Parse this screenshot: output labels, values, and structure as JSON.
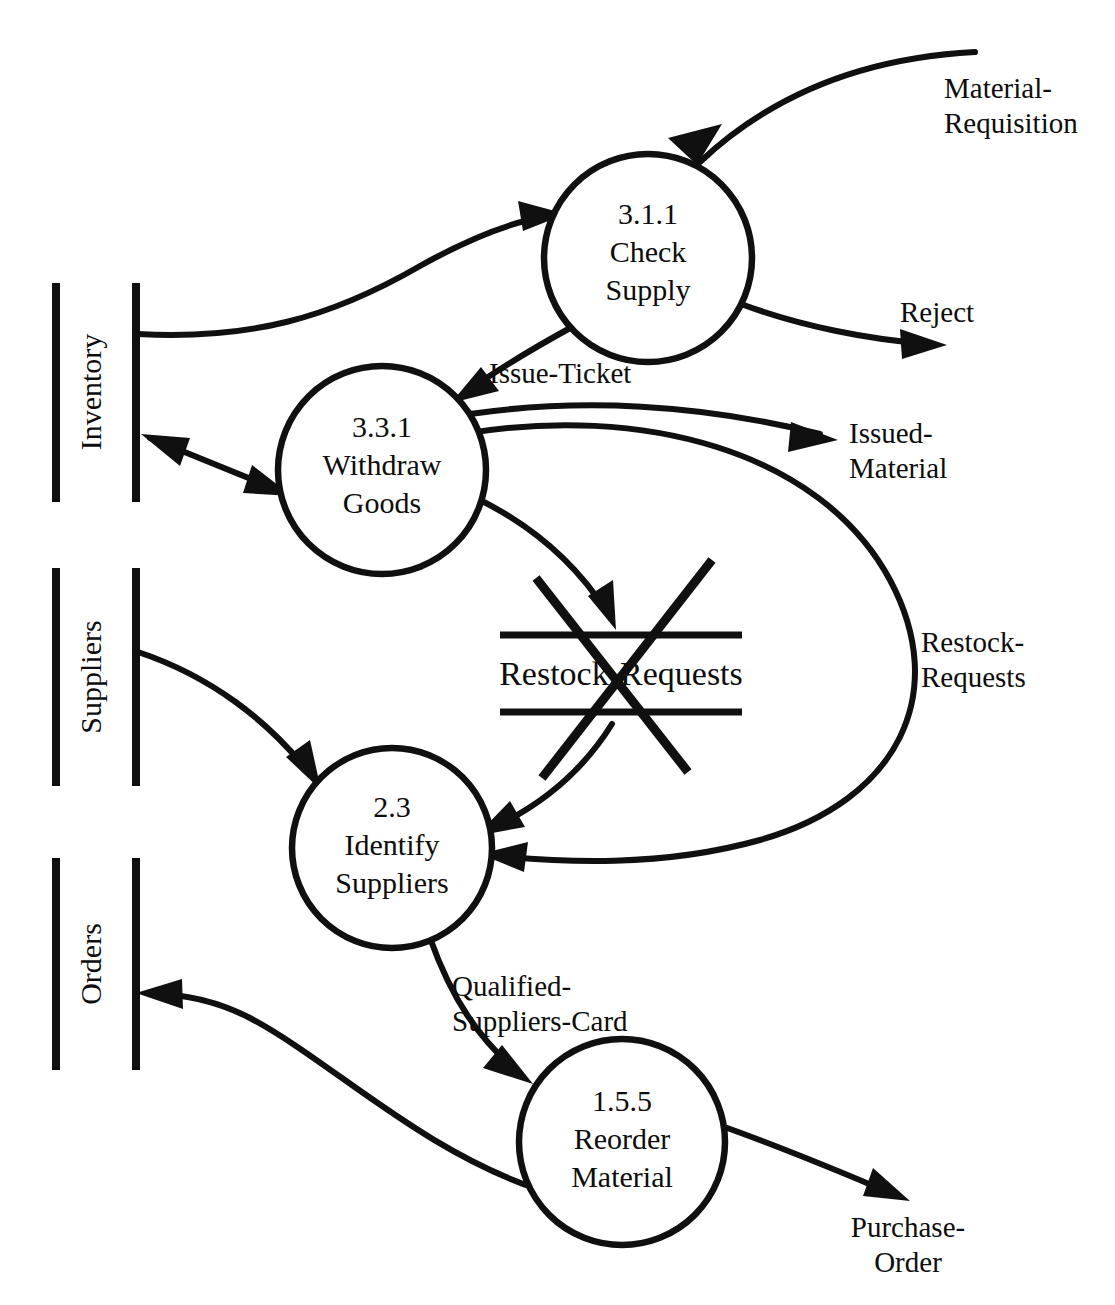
{
  "diagram": {
    "type": "data-flow-diagram",
    "processes": [
      {
        "id": "check-supply",
        "number": "3.1.1",
        "name_line1": "Check",
        "name_line2": "Supply",
        "cx": 648,
        "cy": 258,
        "r": 104
      },
      {
        "id": "withdraw-goods",
        "number": "3.3.1",
        "name_line1": "Withdraw",
        "name_line2": "Goods",
        "cx": 382,
        "cy": 470,
        "r": 104
      },
      {
        "id": "identify-suppliers",
        "number": "2.3",
        "name_line1": "Identify",
        "name_line2": "Suppliers",
        "cx": 392,
        "cy": 848,
        "r": 100
      },
      {
        "id": "reorder-material",
        "number": "1.5.5",
        "name_line1": "Reorder",
        "name_line2": "Material",
        "cx": 622,
        "cy": 1142,
        "r": 103
      }
    ],
    "data_stores": [
      {
        "id": "inventory",
        "label": "Inventory",
        "orientation": "vertical",
        "x_left": 56,
        "x_right": 136,
        "y_top": 283,
        "y_bottom": 502,
        "crossed_out": false
      },
      {
        "id": "suppliers",
        "label": "Suppliers",
        "orientation": "vertical",
        "x_left": 56,
        "x_right": 136,
        "y_top": 568,
        "y_bottom": 786,
        "crossed_out": false
      },
      {
        "id": "orders",
        "label": "Orders",
        "orientation": "vertical",
        "x_left": 56,
        "x_right": 136,
        "y_top": 858,
        "y_bottom": 1070,
        "crossed_out": false
      },
      {
        "id": "restock-requests",
        "label": "Restock-Requests",
        "orientation": "horizontal",
        "x_left": 500,
        "x_right": 742,
        "y_top": 635,
        "y_bottom": 712,
        "crossed_out": true
      }
    ],
    "data_flows": [
      {
        "id": "material-requisition",
        "label_line1": "Material-",
        "label_line2": "Requisition",
        "from": "external",
        "to": "check-supply"
      },
      {
        "id": "reject",
        "label_line1": "Reject",
        "label_line2": "",
        "from": "check-supply",
        "to": "external"
      },
      {
        "id": "inventory-to-check",
        "label_line1": "",
        "label_line2": "",
        "from": "inventory",
        "to": "check-supply"
      },
      {
        "id": "issue-ticket",
        "label_line1": "Issue-Ticket",
        "label_line2": "",
        "from": "check-supply",
        "to": "withdraw-goods"
      },
      {
        "id": "inventory-withdraw",
        "label_line1": "",
        "label_line2": "",
        "from": "inventory",
        "to": "withdraw-goods",
        "bidirectional": true
      },
      {
        "id": "issued-material",
        "label_line1": "Issued-",
        "label_line2": "Material",
        "from": "withdraw-goods",
        "to": "external"
      },
      {
        "id": "restock-to-store",
        "label_line1": "",
        "label_line2": "",
        "from": "withdraw-goods",
        "to": "restock-requests"
      },
      {
        "id": "restock-requests-flow",
        "label_line1": "Restock-",
        "label_line2": "Requests",
        "from": "withdraw-goods",
        "to": "identify-suppliers"
      },
      {
        "id": "restock-store-to-ident",
        "label_line1": "",
        "label_line2": "",
        "from": "restock-requests",
        "to": "identify-suppliers"
      },
      {
        "id": "suppliers-to-identify",
        "label_line1": "",
        "label_line2": "",
        "from": "suppliers",
        "to": "identify-suppliers"
      },
      {
        "id": "qualified-suppliers-card",
        "label_line1": "Qualified-",
        "label_line2": "Suppliers-Card",
        "from": "identify-suppliers",
        "to": "reorder-material"
      },
      {
        "id": "reorder-to-orders",
        "label_line1": "",
        "label_line2": "",
        "from": "reorder-material",
        "to": "orders"
      },
      {
        "id": "purchase-order",
        "label_line1": "Purchase-",
        "label_line2": "Order",
        "from": "reorder-material",
        "to": "external"
      }
    ],
    "caption": ""
  },
  "colors": {
    "ink": "#101010",
    "paper": "#ffffff"
  }
}
